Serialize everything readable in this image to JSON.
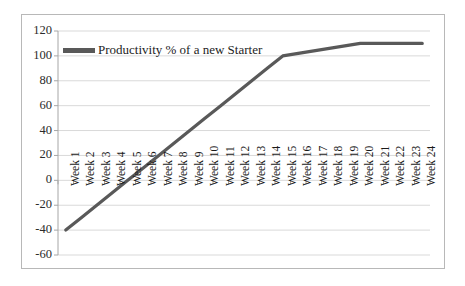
{
  "chart_data": {
    "type": "line",
    "title": "",
    "subtitle": "",
    "xlabel": "",
    "ylabel": "",
    "grid": true,
    "legend_position": "top-left",
    "ylim": [
      -60,
      120
    ],
    "yticks": [
      120,
      100,
      80,
      60,
      40,
      20,
      0,
      -20,
      -40,
      -60
    ],
    "categories": [
      "Week 1",
      "Week 2",
      "Week 3",
      "Week 4",
      "Week 5",
      "Week 6",
      "Week 7",
      "Week 8",
      "Week 9",
      "Week 10",
      "Week 11",
      "Week 12",
      "Week 13",
      "Week 14",
      "Week 15",
      "Week 16",
      "Week 17",
      "Week 18",
      "Week 19",
      "Week 20",
      "Week 21",
      "Week 22",
      "Week 23",
      "Week 24"
    ],
    "series": [
      {
        "name": "Productivity % of a new Starter",
        "color": "#595959",
        "values": [
          -40,
          -30,
          -20,
          -10,
          0,
          10,
          20,
          30,
          40,
          50,
          60,
          70,
          80,
          90,
          100,
          102,
          104,
          106,
          108,
          110,
          110,
          110,
          110,
          110
        ]
      }
    ]
  },
  "legend": {
    "label": "Productivity % of a new Starter"
  },
  "axes": {
    "y_labels": [
      "120",
      "100",
      "80",
      "60",
      "40",
      "20",
      "0",
      "-20",
      "-40",
      "-60"
    ],
    "x_labels": [
      "Week 1",
      "Week 2",
      "Week 3",
      "Week 4",
      "Week 5",
      "Week 6",
      "Week 7",
      "Week 8",
      "Week 9",
      "Week 10",
      "Week 11",
      "Week 12",
      "Week 13",
      "Week 14",
      "Week 15",
      "Week 16",
      "Week 17",
      "Week 18",
      "Week 19",
      "Week 20",
      "Week 21",
      "Week 22",
      "Week 23",
      "Week 24"
    ]
  },
  "colors": {
    "series_line": "#595959",
    "gridline": "#d9d9d9",
    "axis": "#a6a6a6",
    "frame_border": "#b8b8b8",
    "background": "#ffffff",
    "text": "#1d1d1d"
  },
  "geometry": {
    "plot_left": 58,
    "plot_right": 430,
    "plot_top": 31,
    "plot_bottom": 255,
    "y_min": -60,
    "y_max": 120
  }
}
